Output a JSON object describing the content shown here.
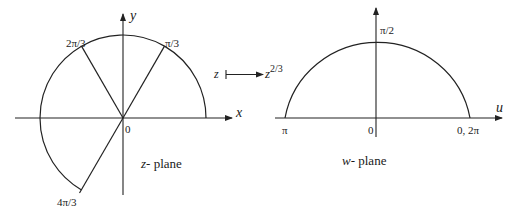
{
  "figure": {
    "z_plane": {
      "caption_var": "z",
      "caption_rest": "- plane",
      "axis_x_label": "x",
      "axis_y_label": "y",
      "origin_label": "0",
      "ray_labels": {
        "pi_over_3": "π/3",
        "two_pi_over_3": "2π/3",
        "four_pi_over_3": "4π/3"
      }
    },
    "mapping": {
      "from": "z",
      "to_base": "z",
      "to_exponent": "2/3"
    },
    "w_plane": {
      "caption_var": "w",
      "caption_rest": "- plane",
      "axis_u_label": "u",
      "origin_label": "0",
      "top_label": "π/2",
      "left_label": "π",
      "right_label": "0, 2π"
    }
  }
}
